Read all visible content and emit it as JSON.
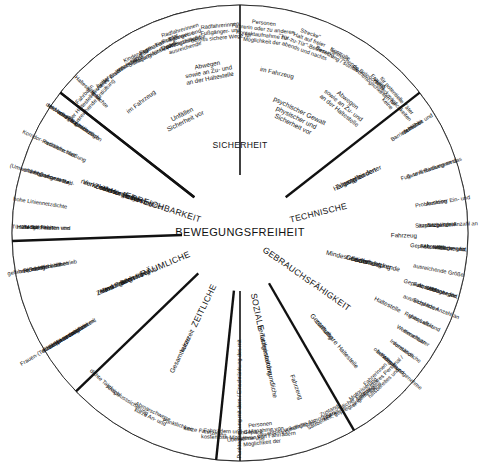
{
  "diagram": {
    "title": "BEWEGUNGSFREIHEIT",
    "type": "radial-hierarchy-wheel",
    "center_label": "BEWEGUNGSFREIHEIT",
    "ring1": [
      {
        "label": "SICHERHEIT"
      },
      {
        "label": "GEBRAUCHSFÄHIGKEIT"
      },
      {
        "label": "TECHNISCHE"
      },
      {
        "label": "SOZIALE"
      },
      {
        "label": "ZEITLICHE"
      },
      {
        "label": "RÄUMLICHE"
      },
      {
        "label": "ERREICHBARKEIT"
      }
    ],
    "divider_labels": [
      "Punktegrenzung mit dem / Einschränkung des mit"
    ],
    "ring2": [
      {
        "label": "Sicherheit vor Unfällen"
      },
      {
        "label": "Sicherheit vor physischer und psychischer Gewalt"
      },
      {
        "label": "ungehinderter Zugang zu den Haltestellen"
      },
      {
        "label": "flächendeckende Gewährleistung einer Mindestausstattung"
      },
      {
        "label": "zumutbare Gestaltung"
      },
      {
        "label": "benutzerinnenfreundliche Tarifgestaltung"
      },
      {
        "label": "kurze Gesamtreisezeit"
      },
      {
        "label": "Bedienung zu allen für Versorgungsarbeit und Frauen relevanten Zeiten"
      },
      {
        "label": "Bedienung der für Versorgungsarbeit und für Frauen relevanten Zielorte – raumzeitlicher Verkehr"
      }
    ],
    "ring3": [
      {
        "label": "im Fahrzeug"
      },
      {
        "label": "an der Haltestelle sowie an Zu- und Abwegen"
      },
      {
        "label": "an der Haltestelle sowie an Zu- und Abwegen"
      },
      {
        "label": "im Fahrzeug"
      },
      {
        "label": "Fahrzeug"
      },
      {
        "label": "Haltestelle"
      },
      {
        "label": "Haltestelle"
      },
      {
        "label": "Fahrzeug"
      }
    ],
    "ring4": [
      {
        "label": "ausreichende Querungshilfen für Fußgänger- und Radfahrerinnen"
      },
      {
        "label": "bereits sichere Wege für Fußgänger- und Radfahrerinnen"
      },
      {
        "label": "Möglichkeit der Kontaktaufnahme zur Fahrerin oder zu anderen Personen"
      },
      {
        "label": "abends und nachts \"Tür-zu-Tür\"-Bedienung \"Halt auf freier Strecke\""
      },
      {
        "label": "Besetzung / soziale Kontrolle"
      },
      {
        "label": "ausreichende Beleuchtung"
      },
      {
        "label": "Fluchtmöglichkeiten für Frauen"
      },
      {
        "label": "keine Versteckmöglichkeiten für potentielle Täter"
      },
      {
        "label": "räumliche und zeitliche Barrierefreiheit"
      },
      {
        "label": "gute Anbindung an das Fuß- und Radwegenetz"
      },
      {
        "label": "Problemloser Ein- und Ausstieg"
      },
      {
        "label": "ausreichende Anzahl an Sitzplätzen/ Sitzplatzgarantie"
      },
      {
        "label": "Ablage- und Abstellflächen für Gepäck, Kinderwagen, Fahrräder"
      },
      {
        "label": "ausreichende Größe"
      },
      {
        "label": "Ablage- und Abstellfläche für Gepäck, Kinderwagen, Fahrräder"
      },
      {
        "label": "ausreichende Anzahl an Sitzplätzen"
      },
      {
        "label": "gute Luft- und Ruhequalität"
      },
      {
        "label": "einsehbarer Wetterschutz"
      },
      {
        "label": "verständliche Information"
      },
      {
        "label": "oberirdische angenehme Wege- und Infrastruktur"
      },
      {
        "label": "hilfsbereites und ansprechbares Personal / Fahrerinnen"
      },
      {
        "label": "angemessene Motorisierung"
      },
      {
        "label": "übersichtlicher Fahrweg"
      },
      {
        "label": "Sauberkeit, gepflegter Zustand"
      },
      {
        "label": "freundliche Atmosphäre"
      },
      {
        "label": "einsehbar, unkompliziert"
      },
      {
        "label": "Möglichkeit der Übernahme von Fahrrädern und Mitnahme von Personen"
      },
      {
        "label": "kostenlose Mitnahme von Fahrrädern und Gepäck"
      },
      {
        "label": "kurze Fahrtzeiten"
      },
      {
        "label": "Pünktlichkeit"
      },
      {
        "label": "kurze An- und Abmarschwege"
      },
      {
        "label": "Anschlusssicherung"
      },
      {
        "label": "dichte Taktfolge"
      },
      {
        "label": "zeitliche Synchronisation mit Kinderbetreuungszeiten, Zeiten sozialer Infrastrukturen, Frauen-(Teilzeit-)Erwerbsarbeit"
      },
      {
        "label": "Richtungsbandbetrieb (Schleifen, die gefahren werden können oder nicht)"
      },
      {
        "label": "Möglichkeiten von Tür-zu-Tür-Fahrten und Halte auf freier Strecke"
      },
      {
        "label": "hohe Liniennetzdichte"
      },
      {
        "label": "Integration in Rad- und Fußwegenetze (Umweltverbundsysteme)"
      },
      {
        "label": "netzhafte statt Korridor-Radialerschließung"
      },
      {
        "label": "direkte Linien nach relevanten Raumbezügen der Versorgungsarbeit und von Frauen"
      },
      {
        "label": "hohe Haltestellendichte"
      },
      {
        "label": "hoher Erschließungsgrad"
      },
      {
        "label": "Möglichkeiten zum Festhalten"
      },
      {
        "label": "rücksichtsvolle Fahrweise"
      },
      {
        "label": "Sicherung für Gepäck, Kinderwagen, Fahrräder"
      },
      {
        "label": "Winterdienst"
      },
      {
        "label": "sicheres Warten"
      },
      {
        "label": "ausreichende Entlüftung der Haltestellen vor der Fahrbahn"
      }
    ],
    "colors": {
      "background": "#ffffff",
      "stroke": "#1a1a1a",
      "text": "#111111"
    }
  }
}
